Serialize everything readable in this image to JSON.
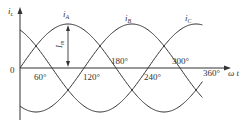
{
  "chart_data": {
    "type": "line",
    "title": "",
    "xlabel": "ωt",
    "ylabel": "i",
    "x_unit": "degrees",
    "x_range": [
      0,
      360
    ],
    "y_range": [
      -1,
      1
    ],
    "tick_labels": [
      "0",
      "60°",
      "120°",
      "180°",
      "240°",
      "300°",
      "360°"
    ],
    "ticks_deg": [
      0,
      60,
      120,
      180,
      240,
      300,
      360
    ],
    "grid": false,
    "series": [
      {
        "name": "i_A",
        "label_main": "i",
        "label_sub": "A",
        "phase_deg": 0,
        "amplitude": 1
      },
      {
        "name": "i_B",
        "label_main": "i",
        "label_sub": "B",
        "phase_deg": -120,
        "amplitude": 1
      },
      {
        "name": "i_C",
        "label_main": "i",
        "label_sub": "C",
        "phase_deg": 120,
        "amplitude": 1
      }
    ],
    "annotations": [
      {
        "text": "I_m",
        "main": "I",
        "sub": "m",
        "meaning": "peak amplitude of i_A at 90°"
      }
    ]
  },
  "axis": {
    "y_label_main": "i",
    "y_label_sub": "L",
    "origin_label": "0",
    "x_label": "ω t"
  },
  "labels": {
    "deg60": "60°",
    "deg120": "120°",
    "deg180": "180°",
    "deg240": "240°",
    "deg300": "300°",
    "deg360": "360°"
  },
  "colors": {
    "line": "#333333",
    "background": "#ffffff"
  }
}
